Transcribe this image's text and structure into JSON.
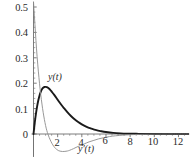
{
  "chart_data": {
    "type": "line",
    "title": "",
    "subtitle": "",
    "xlabel": "",
    "ylabel": "",
    "xlim": [
      -0.3,
      12.9
    ],
    "ylim": [
      -0.09,
      0.52
    ],
    "grid": false,
    "legend_position": "inline-annotations",
    "x_ticks": [
      "2",
      "4",
      "6",
      "8",
      "10",
      "12"
    ],
    "x_tick_values": [
      2,
      4,
      6,
      8,
      10,
      12
    ],
    "y_ticks": [
      "0",
      "0.1",
      "0.2",
      "0.3",
      "0.4",
      "0.5"
    ],
    "y_tick_values": [
      0,
      0.1,
      0.2,
      0.3,
      0.4,
      0.5
    ],
    "annotations": [
      {
        "text": "y(t)",
        "x": 1.6,
        "y": 0.215
      },
      {
        "text": "y'(t)",
        "x": 4.3,
        "y": -0.055
      }
    ],
    "series": [
      {
        "name": "y(t)",
        "color": "#1a1a1a",
        "width": 1.9,
        "x": [
          0,
          0.1,
          0.2,
          0.3,
          0.4,
          0.5,
          0.6,
          0.7,
          0.8,
          0.9,
          1.0,
          1.1,
          1.2,
          1.3,
          1.4,
          1.5,
          1.7,
          1.9,
          2.1,
          2.3,
          2.5,
          2.8,
          3.1,
          3.4,
          3.7,
          4.0,
          4.4,
          4.8,
          5.2,
          5.6,
          6.0,
          6.6,
          7.2,
          7.8,
          8.5,
          9.2,
          10.0,
          11.0,
          12.0,
          12.8
        ],
        "values": [
          0.0,
          0.043,
          0.079,
          0.109,
          0.133,
          0.152,
          0.166,
          0.176,
          0.182,
          0.185,
          0.1855,
          0.1845,
          0.182,
          0.178,
          0.173,
          0.167,
          0.155,
          0.142,
          0.128,
          0.115,
          0.103,
          0.086,
          0.071,
          0.058,
          0.047,
          0.038,
          0.028,
          0.021,
          0.015,
          0.011,
          0.0078,
          0.0045,
          0.0025,
          0.0014,
          0.0007,
          0.0003,
          0.00013,
          4e-05,
          1e-05,
          0.0
        ]
      },
      {
        "name": "y'(t)",
        "color": "#8c8c8c",
        "width": 0.9,
        "x": [
          0,
          0.08,
          0.16,
          0.25,
          0.35,
          0.45,
          0.55,
          0.65,
          0.75,
          0.85,
          0.95,
          1.05,
          1.15,
          1.3,
          1.45,
          1.6,
          1.75,
          1.9,
          2.05,
          2.2,
          2.4,
          2.6,
          2.8,
          3.0,
          3.3,
          3.6,
          3.9,
          4.2,
          4.6,
          5.0,
          5.4,
          5.8,
          6.3,
          6.8,
          7.4,
          8.0,
          8.8,
          9.6,
          10.6,
          11.6,
          12.8
        ],
        "values": [
          0.52,
          0.46,
          0.4,
          0.335,
          0.275,
          0.222,
          0.176,
          0.136,
          0.101,
          0.071,
          0.045,
          0.023,
          0.006,
          -0.014,
          -0.03,
          -0.043,
          -0.053,
          -0.06,
          -0.065,
          -0.0675,
          -0.069,
          -0.0685,
          -0.067,
          -0.064,
          -0.058,
          -0.051,
          -0.045,
          -0.039,
          -0.031,
          -0.025,
          -0.019,
          -0.015,
          -0.01,
          -0.007,
          -0.0045,
          -0.0028,
          -0.0014,
          -0.0007,
          -0.0003,
          -0.0001,
          0.0
        ]
      }
    ],
    "axis_color": "#6e6e6e",
    "y_axis_at_x": 0,
    "x_axis_at_y": 0
  }
}
